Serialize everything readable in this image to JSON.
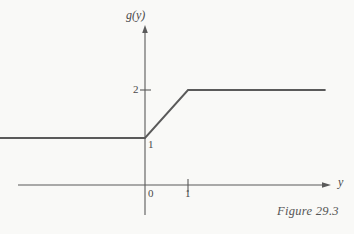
{
  "figure": {
    "caption": "Figure 29.3",
    "background_color": "#f9f9f7",
    "ink_color": "#5a5a5a",
    "text_color": "#4a4a4a"
  },
  "chart_data": {
    "type": "line",
    "title": "",
    "subtitle": "",
    "xlabel": "y",
    "ylabel": "g(y)",
    "x": [
      -3.4,
      0,
      1,
      4.2
    ],
    "y": [
      1,
      1,
      2,
      2
    ],
    "series": [
      {
        "name": "g(y)",
        "x": [
          -3.4,
          0,
          1,
          4.2
        ],
        "values": [
          1,
          1,
          2,
          2
        ]
      }
    ],
    "xlim": [
      -3.4,
      4.2
    ],
    "ylim": [
      -0.7,
      3.3
    ],
    "grid": false,
    "legend": "none",
    "x_ticks": [
      0,
      1
    ],
    "x_tick_labels": [
      "0",
      "1"
    ],
    "y_ticks": [
      1,
      2
    ],
    "y_tick_labels": [
      "1",
      "2"
    ],
    "annotations": [
      "Piecewise linear: g(y) = 1 for y <= 0; g(y) = 1 + y for 0 <= y <= 1; g(y) = 2 for y >= 1"
    ],
    "axis_arrows": [
      "x-positive",
      "y-positive"
    ]
  },
  "labels": {
    "y_axis_name": "g(y)",
    "x_axis_name": "y",
    "y_tick_2": "2",
    "y_tick_1": "1",
    "x_tick_0": "0",
    "x_tick_1": "1"
  }
}
